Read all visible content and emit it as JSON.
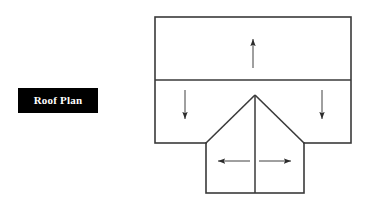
{
  "page": {
    "background_color": "#ffffff",
    "width": 371,
    "height": 206,
    "line_color": "#3a3a3a",
    "fill_color": "#ffffff"
  },
  "label": {
    "text": "Roof Plan",
    "background_color": "#000000",
    "text_color": "#ffffff",
    "x": 18,
    "y": 88,
    "width": 80,
    "height": 25
  },
  "diagram": {
    "title": "Roof Plan",
    "type": "architectural-roof-plan",
    "main_block": {
      "name": "main-roof-rectangle",
      "x": 155,
      "y": 17,
      "width": 196,
      "height": 126
    },
    "ridge_line": {
      "name": "main-ridge",
      "x1": 155,
      "y1": 80,
      "x2": 351,
      "y2": 80
    },
    "wing_block": {
      "name": "gable-wing-rectangle",
      "x": 206,
      "y": 143,
      "width": 98,
      "height": 50
    },
    "wing_apex": {
      "x": 255,
      "y": 95
    },
    "wing_ridge": {
      "name": "wing-ridge",
      "x1": 255,
      "y1": 95,
      "x2": 255,
      "y2": 193
    },
    "hip_left": {
      "x1": 255,
      "y1": 95,
      "x2": 206,
      "y2": 143
    },
    "hip_right": {
      "x1": 255,
      "y1": 95,
      "x2": 304,
      "y2": 143
    }
  },
  "arrows": [
    {
      "name": "slope-arrow-up-top",
      "direction": "up",
      "x1": 253,
      "y1": 68,
      "x2": 253,
      "y2": 38
    },
    {
      "name": "slope-arrow-down-left",
      "direction": "down",
      "x1": 185,
      "y1": 90,
      "x2": 185,
      "y2": 120
    },
    {
      "name": "slope-arrow-down-right",
      "direction": "down",
      "x1": 322,
      "y1": 90,
      "x2": 322,
      "y2": 120
    },
    {
      "name": "slope-arrow-left-wing",
      "direction": "left",
      "x1": 250,
      "y1": 161,
      "x2": 217,
      "y2": 161
    },
    {
      "name": "slope-arrow-right-wing",
      "direction": "right",
      "x1": 259,
      "y1": 161,
      "x2": 292,
      "y2": 161
    }
  ]
}
